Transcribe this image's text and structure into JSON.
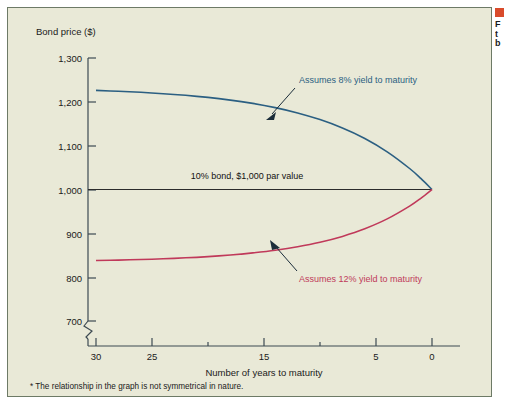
{
  "figure": {
    "background_color": "#e9e9d7",
    "border_color": "#6d7a66",
    "footnote": "* The relationship in the graph is not symmetrical in nature."
  },
  "margin_note": {
    "marker_color": "#d94b2b",
    "lines": [
      "F",
      "t",
      "b"
    ]
  },
  "chart_data": {
    "type": "line",
    "title": "",
    "xlabel": "Number of years to maturity",
    "ylabel": "Bond price ($)",
    "xlim": [
      30,
      0
    ],
    "ylim": [
      680,
      1300
    ],
    "x_reversed": true,
    "grid": false,
    "legend_position": "inline-annotations",
    "axis_break": true,
    "axis_break_note": "y-axis broken below 700",
    "xticks": [
      30,
      25,
      20,
      15,
      10,
      5,
      0
    ],
    "xtick_labels": [
      "30",
      "25",
      "",
      "15",
      "",
      "5",
      "0"
    ],
    "yticks": [
      700,
      800,
      900,
      1000,
      1100,
      1200,
      1300
    ],
    "ytick_labels": [
      "700",
      "800",
      "900",
      "1,000",
      "1,100",
      "1,200",
      "1,300"
    ],
    "x": [
      30,
      28,
      26,
      24,
      22,
      20,
      18,
      16,
      14,
      12,
      10,
      8,
      6,
      4,
      2,
      1,
      0
    ],
    "series": [
      {
        "name": "Assumes 8% yield to maturity",
        "color": "#2b5f82",
        "values": [
          1226,
          1219,
          1211,
          1201,
          1190,
          1177,
          1162,
          1145,
          1124,
          1101,
          1074,
          1043,
          1009,
          966,
          918,
          891,
          1000
        ]
      },
      {
        "name": "Assumes 12% yield to maturity",
        "color": "#c0395a",
        "values": [
          838,
          842,
          847,
          852,
          859,
          866,
          875,
          886,
          898,
          912,
          928,
          947,
          968,
          993,
          1000,
          1000,
          1000
        ]
      },
      {
        "name": "10% bond, $1,000 par value",
        "color": "#2b2b2b",
        "values": [
          1000,
          1000,
          1000,
          1000,
          1000,
          1000,
          1000,
          1000,
          1000,
          1000,
          1000,
          1000,
          1000,
          1000,
          1000,
          1000,
          1000
        ]
      }
    ],
    "annotations": [
      {
        "text": "Assumes 8% yield to maturity",
        "color": "#2b5f82",
        "text_x": 289,
        "text_y": 75,
        "arrow_from_x": 287,
        "arrow_from_y": 80,
        "arrow_to_x": 261,
        "arrow_to_y": 109
      },
      {
        "text": "Assumes 12% yield to maturity",
        "color": "#c0395a",
        "text_x": 289,
        "text_y": 272,
        "arrow_from_x": 288,
        "arrow_from_y": 264,
        "arrow_to_x": 262,
        "arrow_to_y": 235
      },
      {
        "text": "10% bond, $1,000 par value",
        "color": "#111111",
        "text_x": 158,
        "text_y": 170,
        "arrow_from_x": null,
        "arrow_from_y": null,
        "arrow_to_x": null,
        "arrow_to_y": null
      }
    ]
  }
}
